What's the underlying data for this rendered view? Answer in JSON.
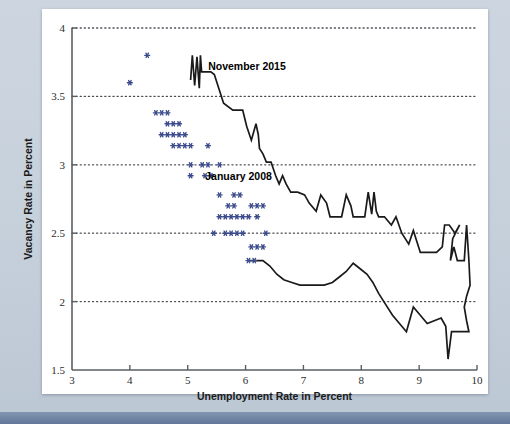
{
  "figure": {
    "background_color": "#c6d0db",
    "card_color": "#ffffff",
    "accent_bar_color": "#61789a"
  },
  "chart_data": {
    "type": "scatter",
    "title": "",
    "subtitle": "",
    "xlabel": "Unemployment Rate in Percent",
    "ylabel": "Vacancy Rate in Percent",
    "xlim": [
      3,
      10
    ],
    "ylim": [
      1.5,
      4
    ],
    "xticks": [
      3,
      4,
      5,
      6,
      7,
      8,
      9,
      10
    ],
    "xtick_labels": [
      "3",
      "4",
      "5",
      "6",
      "7",
      "8",
      "9",
      "10"
    ],
    "yticks": [
      1.5,
      2,
      2.5,
      3,
      3.5,
      4
    ],
    "ytick_labels": [
      "1.5",
      "2",
      "2.5",
      "3",
      "3.5",
      "4"
    ],
    "grid": "horizontal-dotted",
    "gridlines_y": [
      2,
      2.5,
      3,
      3.5,
      4
    ],
    "legend": "none",
    "marker_color": "#3b4a8c",
    "line_color": "#1a1a1a",
    "annotations": [
      {
        "label": "November 2015",
        "x": 5.25,
        "y": 3.72
      },
      {
        "label": "January 2008",
        "x": 5.2,
        "y": 2.92
      }
    ],
    "series": [
      {
        "name": "Beveridge curve points (scatter)",
        "marker": "asterisk",
        "color": "#3b4a8c",
        "points": [
          [
            4.3,
            3.8
          ],
          [
            4.0,
            3.6
          ],
          [
            4.45,
            3.38
          ],
          [
            4.55,
            3.38
          ],
          [
            4.65,
            3.38
          ],
          [
            4.65,
            3.3
          ],
          [
            4.75,
            3.3
          ],
          [
            4.85,
            3.3
          ],
          [
            4.55,
            3.22
          ],
          [
            4.65,
            3.22
          ],
          [
            4.75,
            3.22
          ],
          [
            4.85,
            3.22
          ],
          [
            4.95,
            3.22
          ],
          [
            4.75,
            3.14
          ],
          [
            4.85,
            3.14
          ],
          [
            4.95,
            3.14
          ],
          [
            5.05,
            3.14
          ],
          [
            5.35,
            3.14
          ],
          [
            5.05,
            3.0
          ],
          [
            5.25,
            3.0
          ],
          [
            5.35,
            3.0
          ],
          [
            5.55,
            3.0
          ],
          [
            5.05,
            2.92
          ],
          [
            5.3,
            2.92
          ],
          [
            5.4,
            2.92
          ],
          [
            5.55,
            2.78
          ],
          [
            5.8,
            2.78
          ],
          [
            5.9,
            2.78
          ],
          [
            5.7,
            2.7
          ],
          [
            5.8,
            2.7
          ],
          [
            6.1,
            2.7
          ],
          [
            6.2,
            2.7
          ],
          [
            6.3,
            2.7
          ],
          [
            5.55,
            2.62
          ],
          [
            5.65,
            2.62
          ],
          [
            5.75,
            2.62
          ],
          [
            5.85,
            2.62
          ],
          [
            5.95,
            2.62
          ],
          [
            6.05,
            2.62
          ],
          [
            6.2,
            2.62
          ],
          [
            5.45,
            2.5
          ],
          [
            5.65,
            2.5
          ],
          [
            5.75,
            2.5
          ],
          [
            5.85,
            2.5
          ],
          [
            5.95,
            2.5
          ],
          [
            6.35,
            2.5
          ],
          [
            6.1,
            2.4
          ],
          [
            6.2,
            2.4
          ],
          [
            6.3,
            2.4
          ],
          [
            6.05,
            2.3
          ],
          [
            6.15,
            2.3
          ]
        ]
      },
      {
        "name": "Beveridge curve path (line)",
        "type": "line",
        "color": "#1a1a1a",
        "points": [
          [
            5.05,
            3.62
          ],
          [
            5.08,
            3.8
          ],
          [
            5.12,
            3.58
          ],
          [
            5.16,
            3.79
          ],
          [
            5.2,
            3.56
          ],
          [
            5.22,
            3.8
          ],
          [
            5.24,
            3.68
          ],
          [
            5.4,
            3.68
          ],
          [
            5.46,
            3.66
          ],
          [
            5.62,
            3.45
          ],
          [
            5.78,
            3.4
          ],
          [
            5.86,
            3.4
          ],
          [
            5.95,
            3.4
          ],
          [
            6.02,
            3.28
          ],
          [
            6.1,
            3.18
          ],
          [
            6.18,
            3.3
          ],
          [
            6.22,
            3.22
          ],
          [
            6.24,
            3.12
          ],
          [
            6.3,
            3.08
          ],
          [
            6.36,
            3.02
          ],
          [
            6.44,
            3.02
          ],
          [
            6.52,
            2.92
          ],
          [
            6.58,
            2.86
          ],
          [
            6.64,
            2.92
          ],
          [
            6.7,
            2.86
          ],
          [
            6.78,
            2.8
          ],
          [
            6.9,
            2.8
          ],
          [
            7.02,
            2.78
          ],
          [
            7.1,
            2.72
          ],
          [
            7.22,
            2.66
          ],
          [
            7.3,
            2.78
          ],
          [
            7.4,
            2.72
          ],
          [
            7.46,
            2.62
          ],
          [
            7.54,
            2.62
          ],
          [
            7.66,
            2.62
          ],
          [
            7.74,
            2.78
          ],
          [
            7.82,
            2.7
          ],
          [
            7.86,
            2.62
          ],
          [
            7.96,
            2.62
          ],
          [
            8.06,
            2.62
          ],
          [
            8.12,
            2.8
          ],
          [
            8.18,
            2.64
          ],
          [
            8.22,
            2.8
          ],
          [
            8.26,
            2.66
          ],
          [
            8.3,
            2.62
          ],
          [
            8.4,
            2.62
          ],
          [
            8.52,
            2.56
          ],
          [
            8.6,
            2.62
          ],
          [
            8.7,
            2.5
          ],
          [
            8.82,
            2.42
          ],
          [
            8.9,
            2.52
          ],
          [
            8.96,
            2.44
          ],
          [
            9.02,
            2.36
          ],
          [
            9.14,
            2.36
          ],
          [
            9.3,
            2.36
          ],
          [
            9.4,
            2.4
          ],
          [
            9.44,
            2.56
          ],
          [
            9.52,
            2.56
          ],
          [
            9.62,
            2.5
          ],
          [
            9.7,
            2.56
          ],
          [
            9.58,
            2.46
          ],
          [
            9.54,
            2.3
          ],
          [
            9.6,
            2.4
          ],
          [
            9.66,
            2.3
          ],
          [
            9.78,
            2.3
          ],
          [
            9.82,
            2.56
          ],
          [
            9.86,
            2.3
          ],
          [
            9.88,
            2.12
          ],
          [
            9.82,
            2.04
          ],
          [
            9.78,
            1.96
          ],
          [
            9.82,
            1.86
          ],
          [
            9.86,
            1.78
          ],
          [
            9.68,
            1.78
          ],
          [
            9.56,
            1.78
          ],
          [
            9.5,
            1.58
          ],
          [
            9.46,
            1.82
          ],
          [
            9.38,
            1.88
          ],
          [
            9.26,
            1.86
          ],
          [
            9.14,
            1.84
          ],
          [
            9.02,
            1.9
          ],
          [
            8.9,
            1.96
          ],
          [
            8.78,
            1.78
          ],
          [
            8.66,
            1.84
          ],
          [
            8.54,
            1.9
          ],
          [
            8.42,
            1.98
          ],
          [
            8.3,
            2.06
          ],
          [
            8.2,
            2.14
          ],
          [
            8.1,
            2.2
          ],
          [
            7.98,
            2.24
          ],
          [
            7.86,
            2.28
          ],
          [
            7.74,
            2.22
          ],
          [
            7.62,
            2.18
          ],
          [
            7.5,
            2.14
          ],
          [
            7.36,
            2.12
          ],
          [
            7.22,
            2.12
          ],
          [
            7.08,
            2.12
          ],
          [
            6.94,
            2.12
          ],
          [
            6.8,
            2.14
          ],
          [
            6.66,
            2.16
          ],
          [
            6.54,
            2.2
          ],
          [
            6.42,
            2.26
          ],
          [
            6.3,
            2.3
          ],
          [
            6.18,
            2.3
          ],
          [
            6.06,
            2.3
          ]
        ]
      }
    ]
  }
}
